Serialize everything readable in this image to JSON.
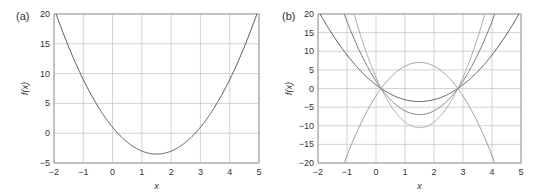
{
  "chart_data": [
    {
      "panel": "(a)",
      "type": "line",
      "xlabel": "x",
      "ylabel": "f(x)",
      "xlim": [
        -2,
        5
      ],
      "ylim": [
        -5,
        20
      ],
      "xticks": [
        -2,
        -1,
        0,
        1,
        2,
        3,
        4,
        5
      ],
      "yticks": [
        -5,
        0,
        5,
        10,
        15,
        20
      ],
      "grid": true,
      "series": [
        {
          "name": "f(x)",
          "coeffs": [
            2,
            -6,
            1
          ],
          "color": "#555555"
        }
      ]
    },
    {
      "panel": "(b)",
      "type": "line",
      "xlabel": "x",
      "ylabel": "f(x)",
      "xlim": [
        -2,
        5
      ],
      "ylim": [
        -20,
        20
      ],
      "xticks": [
        -2,
        -1,
        0,
        1,
        2,
        3,
        4,
        5
      ],
      "yticks": [
        -20,
        -15,
        -10,
        -5,
        0,
        5,
        10,
        15,
        20
      ],
      "grid": true,
      "series": [
        {
          "name": "f(x)",
          "coeffs": [
            2,
            -6,
            1
          ],
          "color": "#555555"
        },
        {
          "name": "2f(x)",
          "coeffs": [
            4,
            -12,
            2
          ],
          "color": "#777777"
        },
        {
          "name": "3f(x)",
          "coeffs": [
            6,
            -18,
            3
          ],
          "color": "#aaaaaa"
        },
        {
          "name": "-2f(x)",
          "coeffs": [
            -4,
            12,
            -2
          ],
          "color": "#999999"
        }
      ]
    }
  ],
  "labels": {
    "a": "(a)",
    "b": "(b)",
    "xlabel": "x",
    "ylabel": "f(x)"
  }
}
